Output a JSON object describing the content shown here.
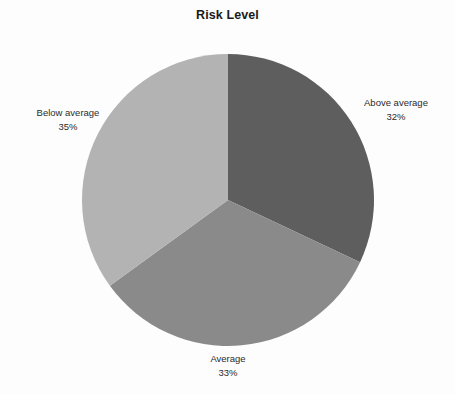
{
  "chart_data": {
    "type": "pie",
    "title": "Risk Level",
    "categories": [
      "Above average",
      "Average",
      "Below average"
    ],
    "values": [
      32,
      33,
      35
    ],
    "value_unit": "%",
    "value_labels": [
      "32%",
      "33%",
      "35%"
    ],
    "colors": [
      "#5e5e5e",
      "#8a8a8a",
      "#b3b3b3"
    ],
    "start_angle_deg": 0,
    "direction": "clockwise",
    "legend": "none",
    "labels_position": "outside",
    "grid": false,
    "background": "#fdfdfd",
    "title_color": "#1a1a1a",
    "label_color": "#2b2b2b",
    "slices": [
      {
        "name": "Above average",
        "value": 32,
        "display_value": "32%",
        "color": "#5e5e5e",
        "label_side": "right"
      },
      {
        "name": "Average",
        "value": 33,
        "display_value": "33%",
        "color": "#8a8a8a",
        "label_side": "bottom"
      },
      {
        "name": "Below average",
        "value": 35,
        "display_value": "35%",
        "color": "#b3b3b3",
        "label_side": "left"
      }
    ]
  }
}
